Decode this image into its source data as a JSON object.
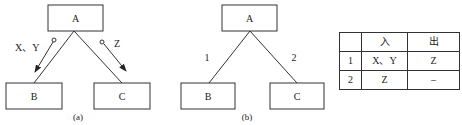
{
  "diagram_a": {
    "caption": "(a)",
    "nodes": {
      "top": "A",
      "left": "B",
      "right": "C"
    },
    "flows": [
      {
        "label": "X、Y",
        "direction": "A→B",
        "marker": "data-couple-arrow"
      },
      {
        "label": "Z",
        "direction": "A→C",
        "marker": "data-couple-arrow"
      }
    ]
  },
  "diagram_b": {
    "caption": "(b)",
    "nodes": {
      "top": "A",
      "left": "B",
      "right": "C"
    },
    "edge_labels": {
      "left": "1",
      "right": "2"
    }
  },
  "table": {
    "headers": [
      "",
      "入",
      "出"
    ],
    "rows": [
      [
        "1",
        "X、Y",
        "Z"
      ],
      [
        "2",
        "Z",
        "–"
      ]
    ]
  },
  "colors": {
    "line": "#333333",
    "text": "#222222",
    "background": "#ffffff"
  }
}
